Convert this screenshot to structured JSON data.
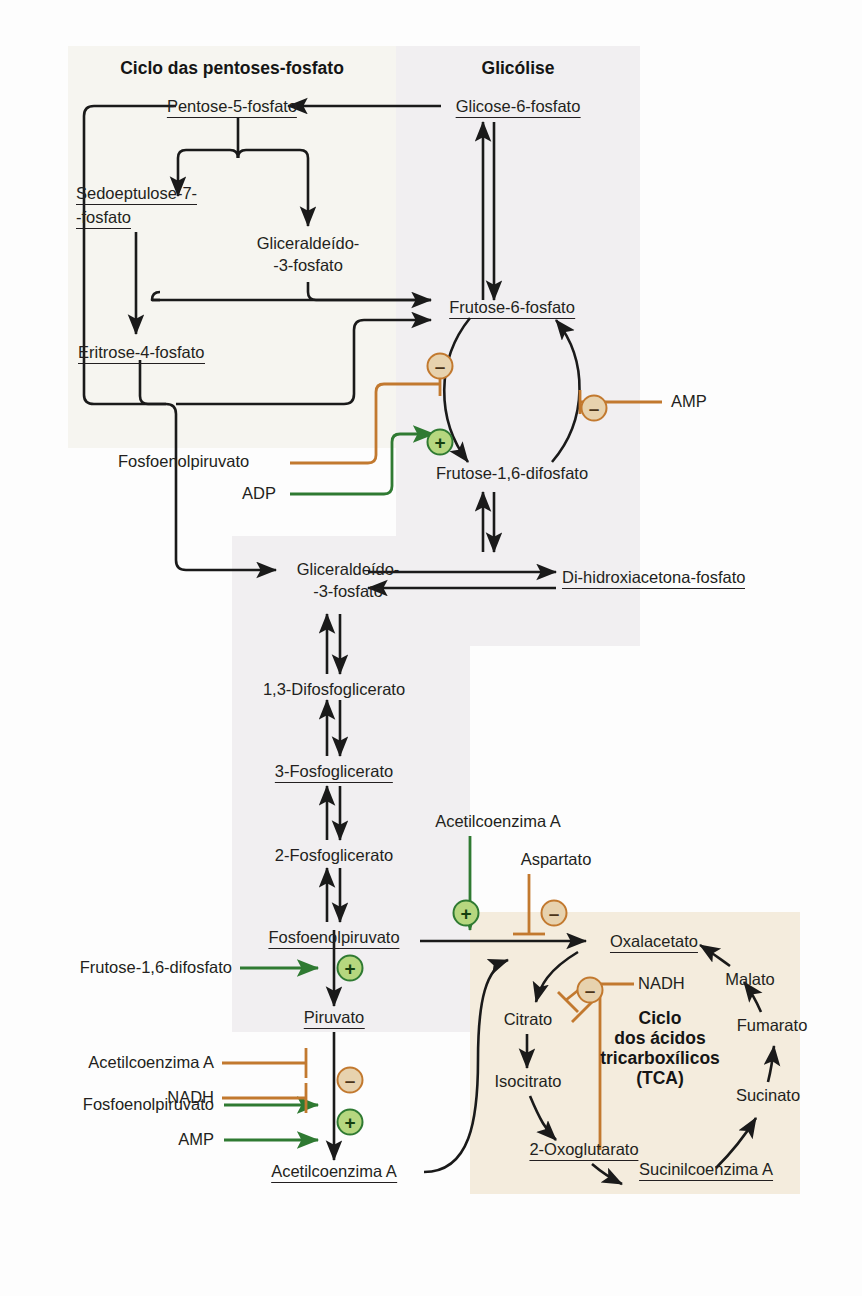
{
  "diagram": {
    "title_pentose": "Ciclo das pentoses-fosfato",
    "title_glycolysis": "Glicólise",
    "title_tca": "Ciclo\ndos ácidos\ntricarboxílicos\n(TCA)",
    "tca_title_lines": [
      "Ciclo",
      "dos ácidos",
      "tricarboxílicos",
      "(TCA)"
    ]
  },
  "colors": {
    "inhibit": "#c2792f",
    "activate": "#2f7a32",
    "arrow": "#1a1a1a",
    "bg_pentose": "#f6f5f0",
    "bg_glycolysis": "#f1eff1",
    "bg_tca": "#f4ecdd",
    "badge_minus_fill": "#e7d2ae",
    "badge_plus_fill": "#b6d77f"
  },
  "metabolites": {
    "pentose_5_fosfato": "Pentose-5-fosfato",
    "sedoeptulose_7_fosfato_l1": "Sedoeptulose-7-",
    "sedoeptulose_7_fosfato_l2": "-fosfato",
    "gliceraldeido_3_fosfato_top_l1": "Gliceraldeído-",
    "gliceraldeido_3_fosfato_top_l2": "-3-fosfato",
    "eritrose_4_fosfato": "Eritrose-4-fosfato",
    "fosfoenolpiruvato_pentose": "Fosfoenolpiruvato",
    "adp": "ADP",
    "glicose_6_fosfato": "Glicose-6-fosfato",
    "frutose_6_fosfato": "Frutose-6-fosfato",
    "frutose_16_difosfato": "Frutose-1,6-difosfato",
    "amp_top": "AMP",
    "gliceraldeido_3_fosfato_mid_l1": "Gliceraldeído-",
    "gliceraldeido_3_fosfato_mid_l2": "-3-fosfato",
    "di_hidroxiacetona_fosfato": "Di-hidroxiacetona-fosfato",
    "difosfoglicerato_13": "1,3-Difosfoglicerato",
    "fosfoglicerato_3": "3-Fosfoglicerato",
    "fosfoglicerato_2": "2-Fosfoglicerato",
    "fosfoenolpiruvato_main": "Fosfoenolpiruvato",
    "piruvato": "Piruvato",
    "acetilcoenzima_a_bottom": "Acetilcoenzima A",
    "acetilcoenzima_a_top": "Acetilcoenzima A",
    "aspartato": "Aspartato",
    "oxalacetato": "Oxalacetato",
    "citrato": "Citrato",
    "isocitrato": "Isocitrato",
    "oxoglutarato_2": "2-Oxoglutarato",
    "sucinilcoenzima_a": "Sucinilcoenzima A",
    "sucinato": "Sucinato",
    "fumarato": "Fumarato",
    "malato": "Malato",
    "nadh_tca": "NADH"
  },
  "effectors": {
    "left_pep_to_f16": "Fosfoenolpiruvato",
    "left_adp_to_f16": "ADP",
    "right_amp_to_f6p": "AMP",
    "frutose16_to_pyruvate": "Frutose-1,6-difosfato",
    "acetilcoa_inhibit": "Acetilcoenzima A",
    "nadh_inhibit": "NADH",
    "pep_activate": "Fosfoenolpiruvato",
    "amp_activate": "AMP"
  },
  "badges": {
    "minus": "–",
    "plus": "+",
    "list": [
      {
        "id": "minus-f6p-left",
        "sign": "–",
        "meaning": "inhibition of fructose-1,6-bisphosphatase by PEP"
      },
      {
        "id": "plus-f16-adp",
        "sign": "+",
        "meaning": "activation by ADP"
      },
      {
        "id": "minus-f6p-right",
        "sign": "–",
        "meaning": "inhibition by AMP"
      },
      {
        "id": "plus-pep-oaa",
        "sign": "+",
        "meaning": "activation by Acetilcoenzima A"
      },
      {
        "id": "minus-oaa-aspartato",
        "sign": "–",
        "meaning": "inhibition by Aspartato"
      },
      {
        "id": "minus-tca-nadh",
        "sign": "–",
        "meaning": "inhibition by NADH"
      },
      {
        "id": "plus-pyruvate-f16",
        "sign": "+",
        "meaning": "activation by Frutose-1,6-difosfato"
      },
      {
        "id": "minus-pdh",
        "sign": "–",
        "meaning": "inhibition by Acetilcoenzima A and NADH"
      },
      {
        "id": "plus-pdh",
        "sign": "+",
        "meaning": "activation by PEP and AMP"
      }
    ]
  }
}
